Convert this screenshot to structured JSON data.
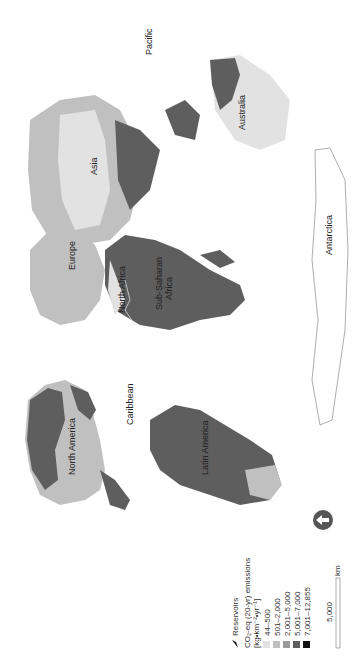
{
  "map": {
    "orientation": "rotated-90-ccw",
    "labels": {
      "north_america": "North America",
      "caribbean": "Caribbean",
      "latin_america": "Latin America",
      "europe": "Europe",
      "north_africa": "North Africa",
      "sub_saharan_africa_1": "Sub-Saharan",
      "sub_saharan_africa_2": "Africa",
      "asia": "Asia",
      "australia": "Australia",
      "antarctica": "Antarctica",
      "pacific": "Pacific"
    }
  },
  "legend": {
    "reservoirs_label": "Reservoirs",
    "title_line1": "CO₂-eq (20-yr) emissions",
    "title_line2": "[kg•km⁻²•yr⁻¹]",
    "classes": [
      {
        "label": "44–500",
        "color": "#e2e2e2"
      },
      {
        "label": "501–2,000",
        "color": "#c0c0c0"
      },
      {
        "label": "2,001–5,000",
        "color": "#9a9a9a"
      },
      {
        "label": "5,001–7,000",
        "color": "#5e5e5e"
      },
      {
        "label": "7,001–12,855",
        "color": "#111111"
      }
    ]
  },
  "scale_bar": {
    "value": "5,000",
    "unit": "km"
  },
  "north_arrow": "north-arrow"
}
